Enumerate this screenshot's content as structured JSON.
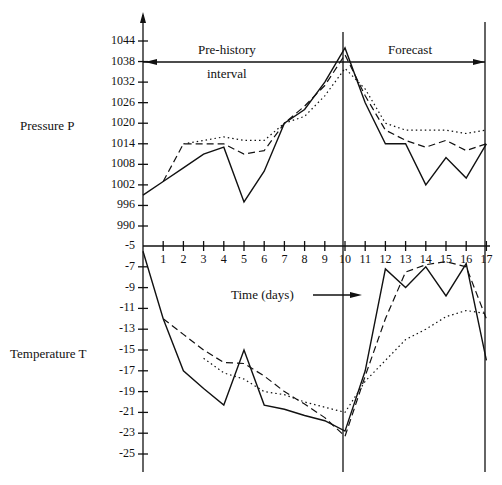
{
  "chart_data": {
    "type": "line",
    "title": "",
    "xlabel": "Time (days)",
    "x": [
      0,
      1,
      2,
      3,
      4,
      5,
      6,
      7,
      8,
      9,
      10,
      11,
      12,
      13,
      14,
      15,
      16,
      17
    ],
    "x_ticks": [
      "1",
      "2",
      "3",
      "4",
      "5",
      "6",
      "7",
      "8",
      "9",
      "10",
      "11",
      "12",
      "13",
      "14",
      "15",
      "16",
      "17"
    ],
    "annotations": {
      "prehistory": [
        "Pre-history",
        "interval"
      ],
      "forecast": "Forecast",
      "time_label": "Time (days)"
    },
    "panels": [
      {
        "name": "Pressure P",
        "ylabel": "Pressure P",
        "y_ticks": [
          "1044",
          "1038",
          "1032",
          "1026",
          "1020",
          "1014",
          "1008",
          "1002",
          "996",
          "990"
        ],
        "ylim": [
          987,
          1047
        ],
        "series": [
          {
            "name": "actual",
            "style": "solid",
            "x": [
              0,
              1,
              2,
              3,
              4,
              5,
              6,
              7,
              8,
              9,
              10,
              11,
              12,
              13,
              14,
              15,
              16,
              17
            ],
            "values": [
              999,
              1003,
              1007,
              1011,
              1013,
              997,
              1006,
              1020,
              1024,
              1032,
              1042,
              1026,
              1014,
              1014,
              1002,
              1010,
              1004,
              1014
            ]
          },
          {
            "name": "model-1",
            "style": "dashed",
            "x": [
              1,
              2,
              3,
              4,
              5,
              6,
              7,
              8,
              9,
              10,
              11,
              12,
              13,
              14,
              15,
              16,
              17
            ],
            "values": [
              1003,
              1014,
              1014,
              1014,
              1011,
              1012,
              1020,
              1025,
              1031,
              1040,
              1028,
              1018,
              1015,
              1013,
              1015,
              1012,
              1014
            ]
          },
          {
            "name": "model-2",
            "style": "dotted",
            "x": [
              2,
              3,
              4,
              5,
              6,
              7,
              8,
              9,
              10,
              11,
              12,
              13,
              14,
              15,
              16,
              17
            ],
            "values": [
              1014,
              1015,
              1016,
              1015,
              1015,
              1020,
              1022,
              1028,
              1036,
              1030,
              1020,
              1018,
              1018,
              1018,
              1017,
              1018
            ]
          }
        ]
      },
      {
        "name": "Temperature T",
        "ylabel": "Temperature T",
        "y_ticks": [
          "-5",
          "-7",
          "-9",
          "-11",
          "-13",
          "-15",
          "-17",
          "-19",
          "-21",
          "-23",
          "-25"
        ],
        "ylim": [
          -27,
          -5
        ],
        "series": [
          {
            "name": "actual",
            "style": "solid",
            "x": [
              0,
              1,
              2,
              3,
              4,
              5,
              6,
              7,
              8,
              9,
              10,
              11,
              12,
              13,
              14,
              15,
              16,
              17
            ],
            "values": [
              -5.5,
              -12,
              -17,
              -18.7,
              -20.3,
              -15,
              -20.3,
              -20.7,
              -21.3,
              -21.8,
              -22.8,
              -17,
              -7.2,
              -9,
              -7,
              -9.8,
              -6.7,
              -16
            ]
          },
          {
            "name": "model-1",
            "style": "dashed",
            "x": [
              1,
              2,
              3,
              4,
              5,
              6,
              7,
              8,
              9,
              10,
              11,
              12,
              13,
              14,
              15,
              16,
              17
            ],
            "values": [
              -12,
              -13.5,
              -15,
              -16.2,
              -16.3,
              -17.5,
              -19,
              -20.2,
              -21.5,
              -23.3,
              -17.5,
              -12,
              -7.5,
              -6.8,
              -6.5,
              -7,
              -12
            ]
          },
          {
            "name": "model-2",
            "style": "dotted",
            "x": [
              3,
              4,
              5,
              6,
              7,
              8,
              9,
              10,
              11,
              12,
              13,
              14,
              15,
              16,
              17
            ],
            "values": [
              -15.8,
              -17.2,
              -17.8,
              -19,
              -19.3,
              -20,
              -20.5,
              -21,
              -18,
              -16,
              -14,
              -13,
              -11.8,
              -11.2,
              -11.5
            ]
          }
        ]
      }
    ]
  },
  "labels": {
    "pressure": "Pressure P",
    "temperature": "Temperature T",
    "prehistory_1": "Pre-history",
    "prehistory_2": "interval",
    "forecast": "Forecast",
    "time": "Time (days)"
  }
}
